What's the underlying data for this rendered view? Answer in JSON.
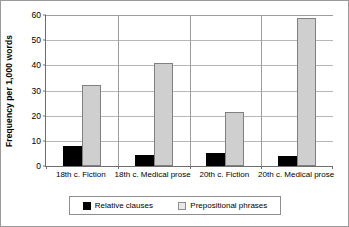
{
  "chart_data": {
    "type": "bar",
    "title": "",
    "subtitle": "",
    "xlabel": "",
    "ylabel": "Frequency per 1,000 words",
    "ylim": [
      0,
      60
    ],
    "yticks": [
      0,
      10,
      20,
      30,
      40,
      50,
      60
    ],
    "ytick_labels": [
      "0",
      "10",
      "20",
      "30",
      "40",
      "50",
      "60"
    ],
    "grid": true,
    "legend_position": "bottom-center",
    "categories": [
      "18th c. Fiction",
      "18th c. Medical prose",
      "20th c. Fiction",
      "20th c. Medical prose"
    ],
    "series": [
      {
        "name": "Relative clauses",
        "color": "#000000",
        "values": [
          8,
          4.5,
          5,
          4
        ]
      },
      {
        "name": "Prepositional phrases",
        "color": "#cfcfcf",
        "values": [
          32,
          41,
          21.5,
          59
        ]
      }
    ]
  },
  "legend": {
    "items": [
      {
        "label": "Relative clauses",
        "swatch": "black"
      },
      {
        "label": "Prepositional phrases",
        "swatch": "grey"
      }
    ]
  },
  "colors": {
    "relative_clauses": "#000000",
    "prepositional_phrases": "#cfcfcf",
    "gridline": "#b7b7b7",
    "axis": "#6e6e6e",
    "frame": "#9a9a9a"
  }
}
